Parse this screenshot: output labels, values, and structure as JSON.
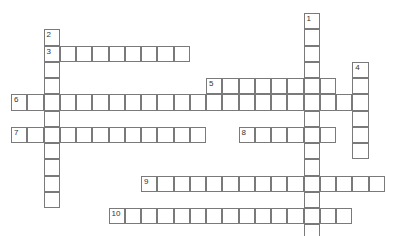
{
  "puzzle": {
    "type": "crossword",
    "grid": {
      "origin_x": 11,
      "origin_y": 13,
      "cell_size": 16.25
    },
    "entries": [
      {
        "number": "1",
        "direction": "down",
        "col": 18,
        "row": 0,
        "length": 14
      },
      {
        "number": "2",
        "direction": "down",
        "col": 2,
        "row": 1,
        "length": 11
      },
      {
        "number": "3",
        "direction": "across",
        "col": 2,
        "row": 2,
        "length": 9
      },
      {
        "number": "4",
        "direction": "down",
        "col": 21,
        "row": 3,
        "length": 6
      },
      {
        "number": "5",
        "direction": "across",
        "col": 12,
        "row": 4,
        "length": 8
      },
      {
        "number": "6",
        "direction": "across",
        "col": 0,
        "row": 5,
        "length": 22
      },
      {
        "number": "7",
        "direction": "across",
        "col": 0,
        "row": 7,
        "length": 12
      },
      {
        "number": "8",
        "direction": "across",
        "col": 14,
        "row": 7,
        "length": 6
      },
      {
        "number": "9",
        "direction": "across",
        "col": 8,
        "row": 10,
        "length": 15
      },
      {
        "number": "10",
        "direction": "across",
        "col": 6,
        "row": 12,
        "length": 15
      }
    ]
  }
}
